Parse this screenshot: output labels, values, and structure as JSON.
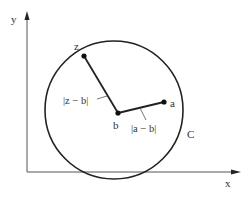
{
  "diagram": {
    "type": "geometry",
    "colors": {
      "stroke": "#222222",
      "axis": "#555555",
      "text": "#333333",
      "background": "#ffffff"
    },
    "axes": {
      "x_label": "x",
      "y_label": "y"
    },
    "points": {
      "z": {
        "label": "z"
      },
      "b": {
        "label": "b"
      },
      "a": {
        "label": "a"
      }
    },
    "circle": {
      "label": "C"
    },
    "segments": {
      "zb": {
        "label": "|z − b|"
      },
      "ab": {
        "label": "|a − b|"
      }
    }
  }
}
